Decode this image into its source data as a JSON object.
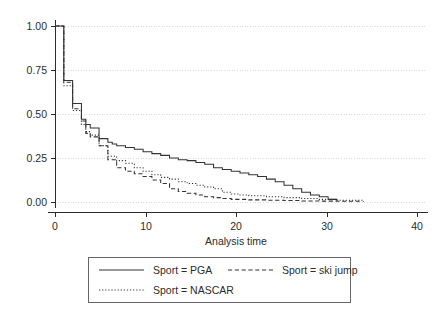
{
  "chart_data": {
    "type": "line",
    "title": "",
    "xlabel": "Analysis time",
    "ylabel": "",
    "xlim": [
      0,
      42
    ],
    "ylim": [
      0,
      1.0
    ],
    "xticks": [
      0,
      10,
      20,
      30,
      40
    ],
    "xtick_labels": [
      "0",
      "10",
      "20",
      "30",
      "40"
    ],
    "yticks": [
      0.0,
      0.25,
      0.5,
      0.75,
      1.0
    ],
    "ytick_labels": [
      "0.00",
      "0.25",
      "0.50",
      "0.75",
      "1.00"
    ],
    "grid": "horizontal-dotted",
    "legend_position": "bottom",
    "step_style": "post",
    "series": [
      {
        "name": "Sport = PGA",
        "key": "pga",
        "style": "solid",
        "color": "#333333",
        "x": [
          0,
          1,
          2,
          3,
          3.5,
          4,
          5,
          6,
          6.5,
          7,
          8,
          9,
          10,
          11,
          12,
          13,
          14,
          15,
          16,
          17,
          18,
          19,
          20,
          21,
          22,
          23,
          24,
          25,
          26,
          27,
          28,
          29,
          30,
          31,
          32
        ],
        "y": [
          1.0,
          0.69,
          0.56,
          0.47,
          0.44,
          0.42,
          0.36,
          0.34,
          0.33,
          0.32,
          0.31,
          0.3,
          0.285,
          0.275,
          0.265,
          0.25,
          0.24,
          0.235,
          0.225,
          0.215,
          0.195,
          0.185,
          0.175,
          0.165,
          0.155,
          0.145,
          0.13,
          0.115,
          0.095,
          0.075,
          0.055,
          0.04,
          0.03,
          0.015,
          0.01
        ]
      },
      {
        "name": "Sport = NASCAR",
        "key": "nascar",
        "style": "dotted",
        "color": "#333333",
        "x": [
          0,
          1,
          2,
          3,
          3.5,
          4,
          5,
          6,
          7,
          8,
          9,
          10,
          11,
          12,
          13,
          14,
          15,
          16,
          17,
          18,
          19,
          20,
          21,
          22,
          24,
          26,
          28,
          30,
          32,
          35
        ],
        "y": [
          1.0,
          0.66,
          0.52,
          0.44,
          0.4,
          0.38,
          0.32,
          0.26,
          0.235,
          0.22,
          0.195,
          0.175,
          0.155,
          0.14,
          0.13,
          0.115,
          0.105,
          0.095,
          0.085,
          0.075,
          0.055,
          0.045,
          0.04,
          0.035,
          0.03,
          0.025,
          0.02,
          0.015,
          0.01,
          0.0
        ]
      },
      {
        "name": "Sport = ski jump",
        "key": "skijump",
        "style": "dashed",
        "color": "#333333",
        "x": [
          0,
          1,
          2,
          3,
          3.5,
          4,
          5,
          6,
          7,
          8,
          9,
          10,
          11,
          12,
          13,
          14,
          15,
          16,
          17,
          18,
          19,
          20,
          22,
          24,
          26,
          28,
          30,
          32,
          34.5
        ],
        "y": [
          1.0,
          0.68,
          0.53,
          0.46,
          0.39,
          0.37,
          0.32,
          0.24,
          0.195,
          0.175,
          0.16,
          0.145,
          0.125,
          0.105,
          0.075,
          0.06,
          0.05,
          0.04,
          0.03,
          0.025,
          0.02,
          0.015,
          0.012,
          0.01,
          0.008,
          0.006,
          0.005,
          0.004,
          0.0
        ]
      }
    ]
  },
  "legend": {
    "entries": [
      {
        "label": "Sport = PGA",
        "key": "pga"
      },
      {
        "label": "Sport = ski jump",
        "key": "skijump"
      },
      {
        "label": "Sport = NASCAR",
        "key": "nascar"
      }
    ]
  },
  "axes": {
    "x_title": "Analysis time",
    "x_labels": [
      "0",
      "10",
      "20",
      "30",
      "40"
    ],
    "y_labels": [
      "1.00",
      "0.75",
      "0.50",
      "0.25",
      "0.00"
    ]
  }
}
